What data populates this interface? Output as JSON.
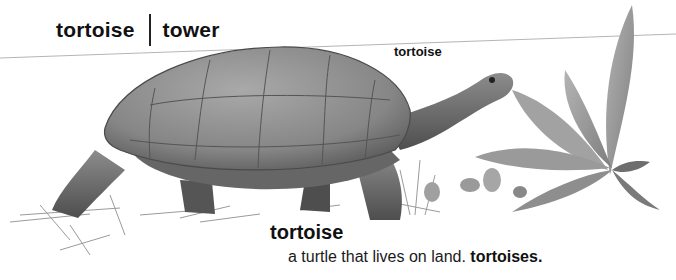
{
  "header": {
    "guide_word_left": "tortoise",
    "guide_word_right": "tower"
  },
  "illustration": {
    "subject": "tortoise eating a leafy plant",
    "caption_label": "tortoise",
    "palette": {
      "shell": "#8e8e8e",
      "shell_dark": "#5a5a5a",
      "skin": "#7a7a7a",
      "leaf": "#9c9c9c",
      "grass": "#8a8a8a",
      "rule_line": "#b5b5b5"
    }
  },
  "entry": {
    "word": "tortoise",
    "definition": "a turtle that lives on land.",
    "plural": "tortoises."
  }
}
